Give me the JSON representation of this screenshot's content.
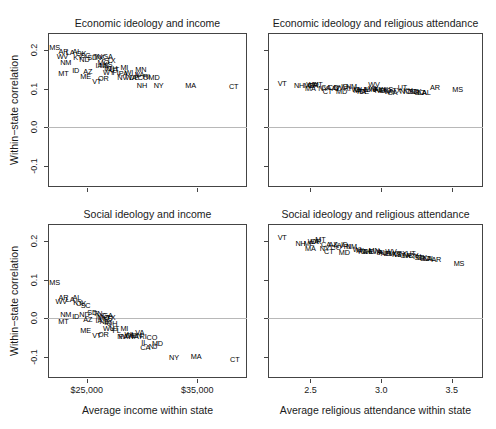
{
  "figure": {
    "axis_titles": {
      "y_left": "Within−state correlation",
      "x_income": "Average income within state",
      "x_religion": "Average religious attendance within state"
    }
  },
  "chart_data": [
    {
      "type": "scatter",
      "title": "Economic ideology and income",
      "panel": "top-left",
      "xlabel": "Average income within state",
      "ylabel": "Within−state correlation",
      "xlim": [
        21500,
        39500
      ],
      "ylim": [
        -0.155,
        0.245
      ],
      "xticks": [
        25000,
        35000
      ],
      "xticklabels": [
        "$25,000",
        "$35,000"
      ],
      "yticks": [
        -0.1,
        0.0,
        0.1,
        0.2
      ],
      "yticklabels": [
        "-0.1",
        "0.0",
        "0.1",
        "0.2"
      ],
      "grid": false,
      "zero_reference_line": 0.0,
      "marker": "text-label",
      "points": [
        {
          "label": "MS",
          "x": 22100,
          "y": 0.207
        },
        {
          "label": "AR",
          "x": 22900,
          "y": 0.196
        },
        {
          "label": "LA",
          "x": 23500,
          "y": 0.192
        },
        {
          "label": "AL",
          "x": 24100,
          "y": 0.196
        },
        {
          "label": "WV",
          "x": 22800,
          "y": 0.182
        },
        {
          "label": "OK",
          "x": 24500,
          "y": 0.19
        },
        {
          "label": "KY",
          "x": 24200,
          "y": 0.18
        },
        {
          "label": "SC",
          "x": 24900,
          "y": 0.186
        },
        {
          "label": "ND",
          "x": 24800,
          "y": 0.176
        },
        {
          "label": "SD",
          "x": 25500,
          "y": 0.181
        },
        {
          "label": "TN",
          "x": 26000,
          "y": 0.182
        },
        {
          "label": "NC",
          "x": 26300,
          "y": 0.18
        },
        {
          "label": "GA",
          "x": 26900,
          "y": 0.183
        },
        {
          "label": "NM",
          "x": 23100,
          "y": 0.167
        },
        {
          "label": "TX",
          "x": 27200,
          "y": 0.173
        },
        {
          "label": "MO",
          "x": 26500,
          "y": 0.166
        },
        {
          "label": "KS",
          "x": 26900,
          "y": 0.163
        },
        {
          "label": "IA",
          "x": 26100,
          "y": 0.158
        },
        {
          "label": "NE",
          "x": 26600,
          "y": 0.158
        },
        {
          "label": "IN",
          "x": 26900,
          "y": 0.152
        },
        {
          "label": "OH",
          "x": 27300,
          "y": 0.152
        },
        {
          "label": "MT",
          "x": 22900,
          "y": 0.139
        },
        {
          "label": "ID",
          "x": 24000,
          "y": 0.146
        },
        {
          "label": "AZ",
          "x": 25100,
          "y": 0.143
        },
        {
          "label": "MI",
          "x": 28400,
          "y": 0.153
        },
        {
          "label": "UT",
          "x": 27500,
          "y": 0.148
        },
        {
          "label": "WY",
          "x": 27000,
          "y": 0.141
        },
        {
          "label": "FL",
          "x": 27700,
          "y": 0.14
        },
        {
          "label": "PA",
          "x": 28300,
          "y": 0.139
        },
        {
          "label": "WI",
          "x": 28800,
          "y": 0.142
        },
        {
          "label": "MN",
          "x": 29900,
          "y": 0.148
        },
        {
          "label": "ME",
          "x": 24900,
          "y": 0.13
        },
        {
          "label": "OR",
          "x": 26500,
          "y": 0.126
        },
        {
          "label": "VT",
          "x": 25900,
          "y": 0.118
        },
        {
          "label": "NV",
          "x": 28200,
          "y": 0.127
        },
        {
          "label": "WA",
          "x": 29000,
          "y": 0.127
        },
        {
          "label": "DE",
          "x": 29300,
          "y": 0.127
        },
        {
          "label": "IL",
          "x": 29600,
          "y": 0.137
        },
        {
          "label": "VA",
          "x": 29800,
          "y": 0.136
        },
        {
          "label": "CO",
          "x": 30100,
          "y": 0.128
        },
        {
          "label": "RI",
          "x": 30400,
          "y": 0.131
        },
        {
          "label": "MD",
          "x": 31100,
          "y": 0.127
        },
        {
          "label": "NH",
          "x": 30000,
          "y": 0.107
        },
        {
          "label": "NY",
          "x": 31500,
          "y": 0.107
        },
        {
          "label": "MA",
          "x": 34400,
          "y": 0.107
        },
        {
          "label": "CT",
          "x": 38300,
          "y": 0.106
        }
      ]
    },
    {
      "type": "scatter",
      "title": "Economic ideology and religious attendance",
      "panel": "top-right",
      "xlabel": "Average religious attendance within state",
      "ylabel": "Within−state correlation",
      "xlim": [
        2.2,
        3.72
      ],
      "ylim": [
        -0.155,
        0.245
      ],
      "xticks": [
        2.5,
        3.0,
        3.5
      ],
      "xticklabels": [
        "2.5",
        "3.0",
        "3.5"
      ],
      "yticks": [
        -0.1,
        0.0,
        0.1,
        0.2
      ],
      "yticklabels": [
        "-0.1",
        "0.0",
        "0.1",
        "0.2"
      ],
      "grid": false,
      "zero_reference_line": 0.0,
      "marker": "text-label",
      "points": [
        {
          "label": "VT",
          "x": 2.3,
          "y": 0.112
        },
        {
          "label": "NH",
          "x": 2.42,
          "y": 0.107
        },
        {
          "label": "ME",
          "x": 2.49,
          "y": 0.108
        },
        {
          "label": "WA",
          "x": 2.51,
          "y": 0.109
        },
        {
          "label": "OR",
          "x": 2.52,
          "y": 0.108
        },
        {
          "label": "MT",
          "x": 2.55,
          "y": 0.11
        },
        {
          "label": "MA",
          "x": 2.5,
          "y": 0.099
        },
        {
          "label": "CA",
          "x": 2.61,
          "y": 0.102
        },
        {
          "label": "NY",
          "x": 2.59,
          "y": 0.099
        },
        {
          "label": "CO",
          "x": 2.66,
          "y": 0.101
        },
        {
          "label": "AZ",
          "x": 2.68,
          "y": 0.1
        },
        {
          "label": "NV",
          "x": 2.7,
          "y": 0.101
        },
        {
          "label": "ID",
          "x": 2.74,
          "y": 0.106
        },
        {
          "label": "NM",
          "x": 2.79,
          "y": 0.106
        },
        {
          "label": "CT",
          "x": 2.62,
          "y": 0.092
        },
        {
          "label": "RI",
          "x": 2.76,
          "y": 0.099
        },
        {
          "label": "MD",
          "x": 2.72,
          "y": 0.092
        },
        {
          "label": "WI",
          "x": 2.82,
          "y": 0.098
        },
        {
          "label": "OH",
          "x": 2.85,
          "y": 0.098
        },
        {
          "label": "MI",
          "x": 2.83,
          "y": 0.094
        },
        {
          "label": "PA",
          "x": 2.86,
          "y": 0.092
        },
        {
          "label": "DE",
          "x": 2.88,
          "y": 0.093
        },
        {
          "label": "IL",
          "x": 2.9,
          "y": 0.097
        },
        {
          "label": "WV",
          "x": 2.95,
          "y": 0.11
        },
        {
          "label": "VA",
          "x": 2.94,
          "y": 0.099
        },
        {
          "label": "MN",
          "x": 2.92,
          "y": 0.097
        },
        {
          "label": "IA",
          "x": 2.96,
          "y": 0.096
        },
        {
          "label": "FL",
          "x": 2.98,
          "y": 0.097
        },
        {
          "label": "NE",
          "x": 2.99,
          "y": 0.095
        },
        {
          "label": "IN",
          "x": 3.01,
          "y": 0.096
        },
        {
          "label": "MO",
          "x": 3.03,
          "y": 0.095
        },
        {
          "label": "KS",
          "x": 3.05,
          "y": 0.096
        },
        {
          "label": "WY",
          "x": 3.06,
          "y": 0.093
        },
        {
          "label": "GA",
          "x": 3.08,
          "y": 0.09
        },
        {
          "label": "TX",
          "x": 3.11,
          "y": 0.094
        },
        {
          "label": "UT",
          "x": 3.15,
          "y": 0.101
        },
        {
          "label": "NC",
          "x": 3.17,
          "y": 0.092
        },
        {
          "label": "KY",
          "x": 3.19,
          "y": 0.094
        },
        {
          "label": "TN",
          "x": 3.21,
          "y": 0.091
        },
        {
          "label": "SD",
          "x": 3.23,
          "y": 0.092
        },
        {
          "label": "OK",
          "x": 3.25,
          "y": 0.091
        },
        {
          "label": "SC",
          "x": 3.27,
          "y": 0.09
        },
        {
          "label": "LA",
          "x": 3.29,
          "y": 0.09
        },
        {
          "label": "AL",
          "x": 3.32,
          "y": 0.089
        },
        {
          "label": "AR",
          "x": 3.38,
          "y": 0.102
        },
        {
          "label": "MS",
          "x": 3.54,
          "y": 0.098
        }
      ]
    },
    {
      "type": "scatter",
      "title": "Social ideology and income",
      "panel": "bottom-left",
      "xlabel": "Average income within state",
      "ylabel": "Within−state correlation",
      "xlim": [
        21500,
        39500
      ],
      "ylim": [
        -0.155,
        0.245
      ],
      "xticks": [
        25000,
        35000
      ],
      "xticklabels": [
        "$25,000",
        "$35,000"
      ],
      "yticks": [
        -0.1,
        0.0,
        0.1,
        0.2
      ],
      "yticklabels": [
        "-0.1",
        "0.0",
        "0.1",
        "0.2"
      ],
      "grid": false,
      "zero_reference_line": 0.0,
      "marker": "text-label",
      "points": [
        {
          "label": "MS",
          "x": 22100,
          "y": 0.093
        },
        {
          "label": "AR",
          "x": 22900,
          "y": 0.054
        },
        {
          "label": "WV",
          "x": 22700,
          "y": 0.043
        },
        {
          "label": "LA",
          "x": 23500,
          "y": 0.047
        },
        {
          "label": "AL",
          "x": 24100,
          "y": 0.052
        },
        {
          "label": "KY",
          "x": 24200,
          "y": 0.039
        },
        {
          "label": "OK",
          "x": 24500,
          "y": 0.037
        },
        {
          "label": "SC",
          "x": 24900,
          "y": 0.033
        },
        {
          "label": "NM",
          "x": 23100,
          "y": 0.008
        },
        {
          "label": "MT",
          "x": 22900,
          "y": -0.009
        },
        {
          "label": "ID",
          "x": 24000,
          "y": 0.003
        },
        {
          "label": "ND",
          "x": 24800,
          "y": 0.008
        },
        {
          "label": "SD",
          "x": 25500,
          "y": 0.013
        },
        {
          "label": "TN",
          "x": 26000,
          "y": 0.012
        },
        {
          "label": "NC",
          "x": 26300,
          "y": 0.005
        },
        {
          "label": "GA",
          "x": 26900,
          "y": 0.005
        },
        {
          "label": "AZ",
          "x": 25100,
          "y": -0.005
        },
        {
          "label": "MO",
          "x": 26500,
          "y": 0.0
        },
        {
          "label": "KS",
          "x": 26900,
          "y": -0.002
        },
        {
          "label": "TX",
          "x": 27200,
          "y": 0.0
        },
        {
          "label": "IA",
          "x": 26100,
          "y": -0.008
        },
        {
          "label": "NE",
          "x": 26600,
          "y": -0.01
        },
        {
          "label": "IN",
          "x": 26900,
          "y": -0.012
        },
        {
          "label": "OH",
          "x": 27300,
          "y": -0.016
        },
        {
          "label": "ME",
          "x": 24900,
          "y": -0.032
        },
        {
          "label": "WY",
          "x": 27000,
          "y": -0.029
        },
        {
          "label": "UT",
          "x": 27500,
          "y": -0.027
        },
        {
          "label": "MI",
          "x": 28400,
          "y": -0.028
        },
        {
          "label": "FL",
          "x": 27700,
          "y": -0.034
        },
        {
          "label": "VT",
          "x": 25900,
          "y": -0.046
        },
        {
          "label": "OR",
          "x": 26500,
          "y": -0.044
        },
        {
          "label": "PA",
          "x": 28300,
          "y": -0.049
        },
        {
          "label": "DE",
          "x": 29000,
          "y": -0.046
        },
        {
          "label": "NV",
          "x": 28200,
          "y": -0.048
        },
        {
          "label": "WI",
          "x": 28800,
          "y": -0.044
        },
        {
          "label": "VA",
          "x": 29800,
          "y": -0.037
        },
        {
          "label": "MN",
          "x": 29500,
          "y": -0.046
        },
        {
          "label": "WA",
          "x": 29200,
          "y": -0.048
        },
        {
          "label": "RI",
          "x": 30100,
          "y": -0.049
        },
        {
          "label": "CO",
          "x": 30900,
          "y": -0.05
        },
        {
          "label": "IL",
          "x": 30200,
          "y": -0.064
        },
        {
          "label": "MD",
          "x": 31400,
          "y": -0.066
        },
        {
          "label": "CA",
          "x": 30300,
          "y": -0.076
        },
        {
          "label": "NJ",
          "x": 31000,
          "y": -0.074
        },
        {
          "label": "NY",
          "x": 32900,
          "y": -0.104
        },
        {
          "label": "MA",
          "x": 34900,
          "y": -0.1
        },
        {
          "label": "CT",
          "x": 38400,
          "y": -0.107
        }
      ]
    },
    {
      "type": "scatter",
      "title": "Social ideology and religious attendance",
      "panel": "bottom-right",
      "xlabel": "Average religious attendance within state",
      "ylabel": "Within−state correlation",
      "xlim": [
        2.2,
        3.72
      ],
      "ylim": [
        -0.155,
        0.245
      ],
      "xticks": [
        2.5,
        3.0,
        3.5
      ],
      "xticklabels": [
        "2.5",
        "3.0",
        "3.5"
      ],
      "yticks": [
        -0.1,
        0.0,
        0.1,
        0.2
      ],
      "yticklabels": [
        "-0.1",
        "0.0",
        "0.1",
        "0.2"
      ],
      "grid": false,
      "zero_reference_line": 0.0,
      "marker": "text-label",
      "points": [
        {
          "label": "VT",
          "x": 2.3,
          "y": 0.208
        },
        {
          "label": "NH",
          "x": 2.43,
          "y": 0.193
        },
        {
          "label": "ME",
          "x": 2.49,
          "y": 0.193
        },
        {
          "label": "WA",
          "x": 2.52,
          "y": 0.199
        },
        {
          "label": "OR",
          "x": 2.54,
          "y": 0.198
        },
        {
          "label": "MT",
          "x": 2.57,
          "y": 0.203
        },
        {
          "label": "MA",
          "x": 2.5,
          "y": 0.181
        },
        {
          "label": "CA",
          "x": 2.61,
          "y": 0.191
        },
        {
          "label": "AZ",
          "x": 2.66,
          "y": 0.19
        },
        {
          "label": "NV",
          "x": 2.7,
          "y": 0.188
        },
        {
          "label": "ID",
          "x": 2.74,
          "y": 0.19
        },
        {
          "label": "NY",
          "x": 2.6,
          "y": 0.18
        },
        {
          "label": "CO",
          "x": 2.68,
          "y": 0.182
        },
        {
          "label": "NM",
          "x": 2.79,
          "y": 0.186
        },
        {
          "label": "RI",
          "x": 2.76,
          "y": 0.184
        },
        {
          "label": "CT",
          "x": 2.63,
          "y": 0.172
        },
        {
          "label": "MD",
          "x": 2.74,
          "y": 0.17
        },
        {
          "label": "WI",
          "x": 2.83,
          "y": 0.177
        },
        {
          "label": "MI",
          "x": 2.85,
          "y": 0.175
        },
        {
          "label": "PA",
          "x": 2.87,
          "y": 0.172
        },
        {
          "label": "OH",
          "x": 2.89,
          "y": 0.173
        },
        {
          "label": "DE",
          "x": 2.91,
          "y": 0.172
        },
        {
          "label": "IL",
          "x": 2.93,
          "y": 0.173
        },
        {
          "label": "MN",
          "x": 2.95,
          "y": 0.174
        },
        {
          "label": "VA",
          "x": 2.97,
          "y": 0.171
        },
        {
          "label": "IA",
          "x": 2.99,
          "y": 0.17
        },
        {
          "label": "FL",
          "x": 3.01,
          "y": 0.169
        },
        {
          "label": "NE",
          "x": 3.03,
          "y": 0.168
        },
        {
          "label": "IN",
          "x": 3.05,
          "y": 0.167
        },
        {
          "label": "WV",
          "x": 3.07,
          "y": 0.172
        },
        {
          "label": "MO",
          "x": 3.09,
          "y": 0.166
        },
        {
          "label": "KS",
          "x": 3.11,
          "y": 0.165
        },
        {
          "label": "WY",
          "x": 3.13,
          "y": 0.164
        },
        {
          "label": "TX",
          "x": 3.15,
          "y": 0.166
        },
        {
          "label": "GA",
          "x": 3.17,
          "y": 0.163
        },
        {
          "label": "NC",
          "x": 3.19,
          "y": 0.162
        },
        {
          "label": "UT",
          "x": 3.21,
          "y": 0.167
        },
        {
          "label": "KY",
          "x": 3.23,
          "y": 0.161
        },
        {
          "label": "TN",
          "x": 3.25,
          "y": 0.158
        },
        {
          "label": "SD",
          "x": 3.27,
          "y": 0.157
        },
        {
          "label": "OK",
          "x": 3.29,
          "y": 0.156
        },
        {
          "label": "SC",
          "x": 3.31,
          "y": 0.155
        },
        {
          "label": "LA",
          "x": 3.33,
          "y": 0.154
        },
        {
          "label": "AL",
          "x": 3.35,
          "y": 0.153
        },
        {
          "label": "AR",
          "x": 3.39,
          "y": 0.152
        },
        {
          "label": "MS",
          "x": 3.55,
          "y": 0.14
        }
      ]
    }
  ]
}
